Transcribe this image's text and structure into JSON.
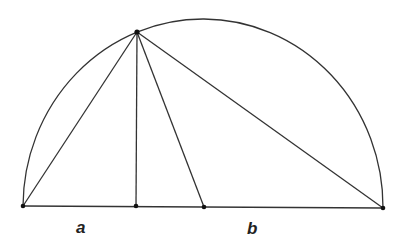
{
  "diagram": {
    "type": "semicircle-geometric-mean",
    "labels": {
      "a": "a",
      "b": "b"
    },
    "points": {
      "left_end": [
        23,
        206
      ],
      "foot": [
        136,
        206
      ],
      "center": [
        204,
        207
      ],
      "right_end": [
        383,
        208
      ],
      "apex": [
        137,
        32
      ]
    },
    "stroke_color": "#333333",
    "background": "#ffffff"
  }
}
